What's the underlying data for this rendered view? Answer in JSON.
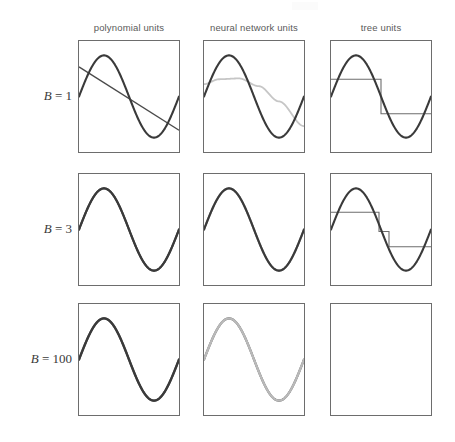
{
  "figure": {
    "name": "function-approximation-grid",
    "background_color": "#ffffff",
    "frame_color": "#6d6d6d",
    "true_curve_color": "#3a3a3a",
    "fit_dark_color": "#4a4a4a",
    "fit_light_color": "#b9b9b9",
    "fit_mid_color": "#8a8a8a"
  },
  "columns": [
    {
      "id": "polynomial-units",
      "label": "polynomial units",
      "x": 78,
      "width": 102
    },
    {
      "id": "neural-network-units",
      "label": "neural network units",
      "x": 203,
      "width": 102
    },
    {
      "id": "tree-units",
      "label": "tree units",
      "x": 330,
      "width": 102
    }
  ],
  "rows": [
    {
      "id": "b-1",
      "label_symbol": "B",
      "label_eq": "=",
      "label_value": "1",
      "label": "B = 1",
      "y": 40,
      "height": 113
    },
    {
      "id": "b-3",
      "label_symbol": "B",
      "label_eq": "=",
      "label_value": "3",
      "label": "B = 3",
      "y": 173,
      "height": 113
    },
    {
      "id": "b-100",
      "label_symbol": "B",
      "label_eq": "=",
      "label_value": "100",
      "label": "B = 100",
      "y": 303,
      "height": 113
    }
  ],
  "chart_data": {
    "type": "line",
    "title": "",
    "xlabel": "",
    "ylabel": "",
    "xlim": [
      0,
      1
    ],
    "ylim": [
      -1.35,
      1.35
    ],
    "grid": false,
    "legend": "none",
    "target_function": {
      "name": "true function",
      "form": "sine",
      "expression": "y = sin(2*pi*x + phase)",
      "amplitude": 1.0,
      "cycles": 1.0,
      "phase_deg": 0,
      "color": "#3a3a3a"
    },
    "panels": [
      {
        "row": "B = 1",
        "column": "polynomial units",
        "fit_type": "linear",
        "fit_color": "#4a4a4a",
        "fit_description": "single descending straight line from upper-left to lower-right",
        "fit_points_x": [
          0.0,
          1.0
        ],
        "fit_points_y": [
          0.72,
          -0.82
        ],
        "quality": "poor"
      },
      {
        "row": "B = 1",
        "column": "neural network units",
        "fit_type": "sigmoid-like",
        "fit_color": "#c6c6c6",
        "fit_description": "shallow broad arch rising then slowly falling, far from the target",
        "fit_points_x": [
          0.0,
          0.15,
          0.35,
          0.55,
          0.75,
          1.0
        ],
        "fit_points_y": [
          0.3,
          0.42,
          0.44,
          0.25,
          -0.12,
          -0.72
        ],
        "quality": "poor"
      },
      {
        "row": "B = 1",
        "column": "tree units",
        "fit_type": "step",
        "fit_color": "#6d6d6d",
        "fit_description": "single split: high constant level on the left half, low constant level on the right half",
        "breakpoints_x": [
          0.0,
          0.5,
          1.0
        ],
        "levels": [
          0.42,
          -0.42
        ],
        "quality": "poor"
      },
      {
        "row": "B = 3",
        "column": "polynomial units",
        "fit_type": "cubic",
        "fit_color": "#4a4a4a",
        "fit_description": "cubic polynomial nearly coincident with the sine",
        "quality": "good"
      },
      {
        "row": "B = 3",
        "column": "neural network units",
        "fit_type": "sigmoid-sum",
        "fit_color": "#8a8a8a",
        "fit_description": "sum of three sigmoids, closely tracks the sine with a faint gray shadow",
        "quality": "good"
      },
      {
        "row": "B = 3",
        "column": "tree units",
        "fit_type": "step",
        "fit_color": "#6d6d6d",
        "fit_description": "three-level staircase approximating the sine",
        "breakpoints_x": [
          0.0,
          0.48,
          0.58,
          1.0
        ],
        "levels": [
          0.42,
          -0.05,
          -0.42
        ],
        "quality": "fair"
      },
      {
        "row": "B = 100",
        "column": "polynomial units",
        "fit_type": "high-order polynomial",
        "fit_color": "#4a4a4a",
        "fit_description": "indistinguishable from the target sine",
        "quality": "excellent"
      },
      {
        "row": "B = 100",
        "column": "neural network units",
        "fit_type": "sigmoid-sum",
        "fit_color": "#b9b9b9",
        "fit_description": "light gray curve lying exactly on the target sine",
        "quality": "excellent"
      },
      {
        "row": "B = 100",
        "column": "tree units",
        "fit_type": "step",
        "fit_color": "#3a3a3a",
        "fit_description": "fine staircase indistinguishable from the target sine at this scale",
        "quality": "excellent"
      }
    ]
  }
}
